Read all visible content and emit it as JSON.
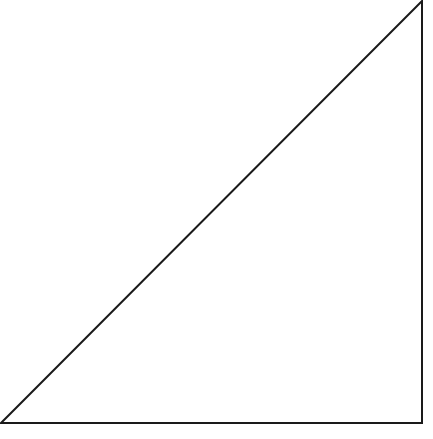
{
  "diagram": {
    "shape": "right-triangle",
    "stroke_color": "#1a1a1a",
    "fill_color": "#ffffff",
    "stroke_width": 2,
    "vertices": {
      "bottom_left": [
        1,
        423
      ],
      "top_right": [
        422,
        1
      ],
      "bottom_right": [
        422,
        423
      ]
    },
    "right_angle_at": "bottom_right"
  },
  "caption": {
    "text": "",
    "note_clipped": true
  }
}
